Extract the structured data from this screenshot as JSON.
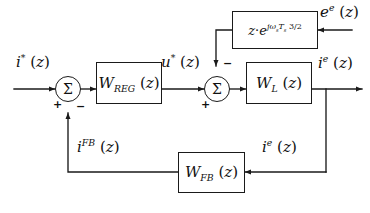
{
  "diagram": {
    "type": "control-block-diagram",
    "line_color": "#1a1a1a",
    "background": "#ffffff"
  },
  "blocks": [
    {
      "id": "w_reg",
      "label": "W_REG (z)",
      "base": "W",
      "sub": "REG",
      "arg": "(z)"
    },
    {
      "id": "w_l",
      "label": "W_L (z)",
      "base": "W",
      "sub": "L",
      "arg": "(z)"
    },
    {
      "id": "w_fb",
      "label": "W_FB (z)",
      "base": "W",
      "sub": "FB",
      "arg": "(z)"
    },
    {
      "id": "delay",
      "label": "z · e^{jw_s T_s 3/2}",
      "prefix": "z",
      "dot": "·",
      "expbase": "e",
      "exponent": "jw_s T_s 3/2"
    }
  ],
  "summers": [
    {
      "id": "sum1",
      "symbol": "Σ",
      "input_left_sign": "+",
      "input_bottom_sign": "−"
    },
    {
      "id": "sum2",
      "symbol": "Σ",
      "input_left_sign": "+",
      "input_top_sign": "−"
    }
  ],
  "signals": {
    "reference": {
      "base": "i",
      "sup": "*",
      "arg": "(z)",
      "text": "i*(z)"
    },
    "control": {
      "base": "u",
      "sup": "*",
      "arg": "(z)",
      "text": "u*(z)"
    },
    "emf": {
      "base": "e",
      "sup": "e",
      "arg": "(z)",
      "text": "e^e(z)"
    },
    "output_current": {
      "base": "i",
      "sup": "e",
      "arg": "(z)",
      "text": "i^e(z)"
    },
    "feedback": {
      "base": "i",
      "sup": "FB",
      "arg": "(z)",
      "text": "i^FB(z)"
    },
    "measured": {
      "base": "i",
      "sup": "e",
      "arg": "(z)",
      "text": "i^e(z)"
    }
  },
  "exponent_parts": {
    "j": "j",
    "omega": "ω",
    "omega_sub": "s",
    "T": "T",
    "T_sub": "s",
    "factor": "3/2"
  },
  "signs": {
    "plus": "+",
    "minus": "−"
  }
}
